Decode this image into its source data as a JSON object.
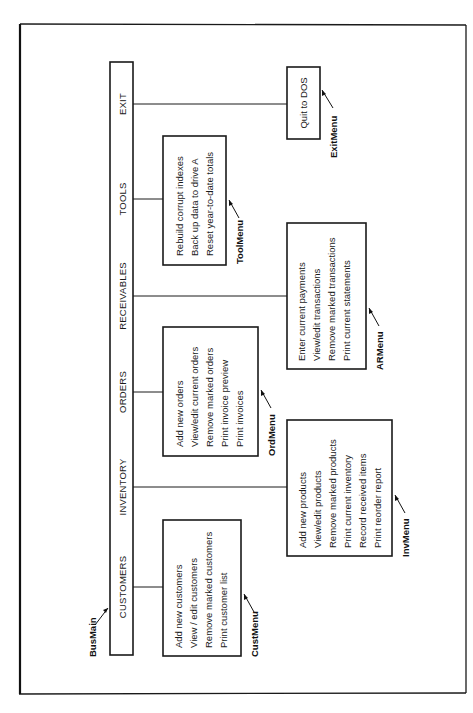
{
  "diagram": {
    "main_menu": {
      "name": "BusMain",
      "items": [
        {
          "label": "CUSTOMERS"
        },
        {
          "label": "INVENTORY"
        },
        {
          "label": "ORDERS"
        },
        {
          "label": "RECEIVABLES"
        },
        {
          "label": "TOOLS"
        },
        {
          "label": "EXIT"
        }
      ]
    },
    "submenus": {
      "cust": {
        "name": "CustMenu",
        "parent": "CUSTOMERS",
        "items": [
          "Add new customers",
          "View / edit customers",
          "Remove marked customers",
          "Print customer list"
        ]
      },
      "inv": {
        "name": "InvMenu",
        "parent": "INVENTORY",
        "items": [
          "Add new products",
          "View/edit products",
          "Remove marked products",
          "Print current inventory",
          "Record received items",
          "Print reorder report"
        ]
      },
      "ord": {
        "name": "OrdMenu",
        "parent": "ORDERS",
        "items": [
          "Add new orders",
          "View/edit current orders",
          "Remove marked orders",
          "Print invoice preview",
          "Print invoices"
        ]
      },
      "ar": {
        "name": "ARMenu",
        "parent": "RECEIVABLES",
        "items": [
          "Enter current payments",
          "View/edit transactions",
          "Remove marked transactions",
          "Print current statements"
        ]
      },
      "tool": {
        "name": "ToolMenu",
        "parent": "TOOLS",
        "items": [
          "Rebuild corrupt indexes",
          "Back up data to drive A",
          "Reset year-to-date totals"
        ]
      },
      "exit": {
        "name": "ExitMenu",
        "parent": "EXIT",
        "items": [
          "Quit to DOS"
        ]
      }
    }
  }
}
